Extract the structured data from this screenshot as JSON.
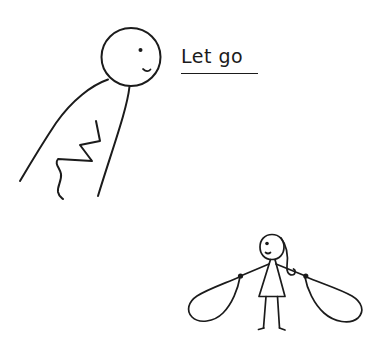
{
  "scene": {
    "title": "Let go",
    "background_color": "#ffffff",
    "ink_color": "#1b1b1b",
    "width": 377,
    "height": 341,
    "style": "hand-drawn stick-figure doodle"
  },
  "caption": {
    "text": "Let go",
    "underlined": true,
    "x": 181,
    "y": 47,
    "font_size": 19
  },
  "figures": [
    {
      "id": "upper-figure",
      "name": "leaning-stick-figure",
      "description": "Large-headed stick figure bending forward from upper left, one eye and a small smile, body drawn as two long sweeping curves with a zigzag arm between them",
      "head": {
        "cx": 131,
        "cy": 57,
        "r": 29
      },
      "eye": {
        "cx": 140,
        "cy": 50,
        "r": 1.8
      },
      "mouth": "small curve near right of head",
      "parts": [
        "head",
        "eye",
        "mouth",
        "back-curve",
        "front-curve",
        "zigzag-arm",
        "neck"
      ]
    },
    {
      "id": "lower-figure",
      "name": "girl-with-rope-loops",
      "description": "Small stick girl in a triangular dress with long hair curling to the right, arms extended holding two teardrop rope loops, one in each hand",
      "head": {
        "cx": 272,
        "cy": 247,
        "rx": 11,
        "ry": 13
      },
      "eye": {
        "cx": 267,
        "cy": 243,
        "r": 1.6
      },
      "hands": [
        {
          "side": "left",
          "x": 240,
          "y": 276
        },
        {
          "side": "right",
          "x": 306,
          "y": 276
        }
      ],
      "parts": [
        "head",
        "eye",
        "mouth",
        "hair",
        "dress",
        "left-arm",
        "right-arm",
        "left-hand-knot",
        "right-hand-knot",
        "left-leg",
        "right-leg",
        "left-foot",
        "right-foot"
      ]
    }
  ],
  "props": [
    {
      "id": "left-rope-loop",
      "name": "rope-loop-left",
      "description": "Teardrop shaped rope loop hanging from the girl's left hand toward the lower left"
    },
    {
      "id": "right-rope-loop",
      "name": "rope-loop-right",
      "description": "Teardrop shaped rope loop hanging from the girl's right hand toward the lower right"
    }
  ]
}
